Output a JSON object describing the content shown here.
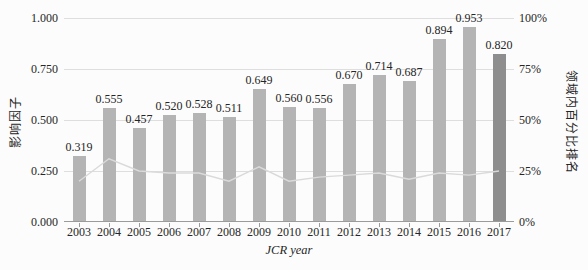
{
  "chart_data": {
    "type": "combo-bar-line",
    "categories": [
      "2003",
      "2004",
      "2005",
      "2006",
      "2007",
      "2008",
      "2009",
      "2010",
      "2011",
      "2012",
      "2013",
      "2014",
      "2015",
      "2016",
      "2017"
    ],
    "series": [
      {
        "name": "影响因子",
        "type": "bar",
        "axis": "left",
        "values": [
          0.319,
          0.555,
          0.457,
          0.52,
          0.528,
          0.511,
          0.649,
          0.56,
          0.556,
          0.67,
          0.714,
          0.687,
          0.894,
          0.953,
          0.82
        ]
      },
      {
        "name": "领域内百分比排名",
        "type": "line",
        "axis": "right",
        "unit": "%",
        "values": [
          20,
          31,
          25,
          24,
          24,
          20,
          27,
          20,
          22,
          23,
          24,
          21,
          24,
          23,
          25
        ]
      }
    ],
    "data_labels": [
      "0.319",
      "0.555",
      "0.457",
      "0.520",
      "0.528",
      "0.511",
      "0.649",
      "0.560",
      "0.556",
      "0.670",
      "0.714",
      "0.687",
      "0.894",
      "0.953",
      "0.820"
    ],
    "left_axis": {
      "title": "影响因子",
      "min": 0,
      "max": 1,
      "ticks": [
        "1.000",
        "0.750",
        "0.500",
        "0.250",
        "0.000"
      ]
    },
    "right_axis": {
      "title": "领域内百分比排名",
      "min": 0,
      "max": 100,
      "ticks": [
        "100%",
        "75%",
        "50%",
        "25%",
        "0%"
      ]
    },
    "xlabel": "JCR year",
    "grid": true,
    "legend": "none",
    "colors": {
      "bar": "#b4b4b4",
      "bar_last": "#8e8e8e",
      "line": "#dadada",
      "gridline": "#dedede",
      "axis": "#9b9b9b",
      "text": "#262626"
    }
  }
}
